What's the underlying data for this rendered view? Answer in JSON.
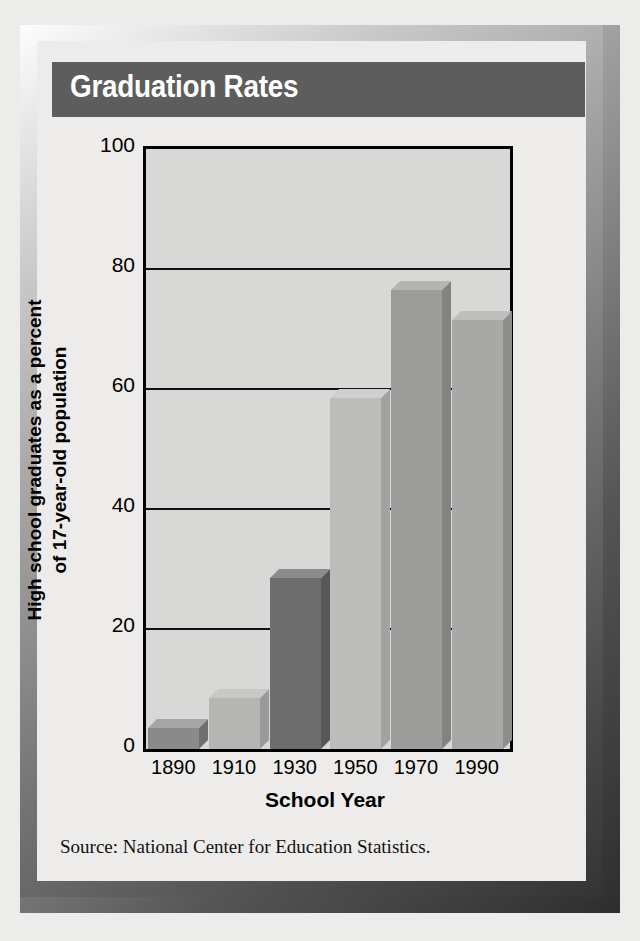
{
  "figure": {
    "title": "Graduation Rates",
    "source_note": "Source:  National Center for Education Statistics.",
    "title_band_color": "#5d5d5d",
    "plot_background_color": "#d8d8d6",
    "card_background_color": "#edecea"
  },
  "chart_data": {
    "type": "bar",
    "title": "Graduation Rates",
    "xlabel": "School Year",
    "ylabel": "High school graduates as a percent of 17-year-old population",
    "ylabel_line1": "High school graduates as a percent",
    "ylabel_line2": "of 17-year-old population",
    "categories": [
      "1890",
      "1910",
      "1930",
      "1950",
      "1970",
      "1990"
    ],
    "values": [
      3.5,
      8.5,
      28.5,
      58.5,
      76.5,
      71.5
    ],
    "ylim": [
      0,
      100
    ],
    "yticks": [
      0,
      20,
      40,
      60,
      80,
      100
    ],
    "ytick_labels": [
      "0",
      "20",
      "40",
      "60",
      "80",
      "100"
    ],
    "grid": true,
    "legend": "none",
    "bar_colors": [
      "#8a8a8a",
      "#b5b5b3",
      "#6e6e6e",
      "#bcbcba",
      "#9c9c9a",
      "#a8a8a6"
    ],
    "bar_top_colors": [
      "#a5a5a5",
      "#c8c8c6",
      "#8c8c8c",
      "#cfcfcd",
      "#b4b4b2",
      "#bebebc"
    ],
    "bar_side_colors": [
      "#6f6f6f",
      "#9a9a98",
      "#585858",
      "#a2a2a0",
      "#828280",
      "#8d8d8b"
    ],
    "style": "3d-bars"
  }
}
